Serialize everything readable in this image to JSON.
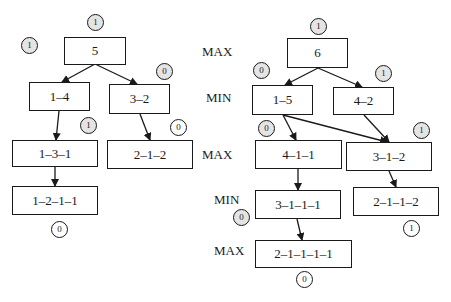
{
  "left_tree": {
    "nodes": [
      {
        "id": "L0",
        "label": "5",
        "badge": "1"
      },
      {
        "id": "L1",
        "label": "1–4",
        "badge": "1"
      },
      {
        "id": "L2",
        "label": "3–2",
        "badge": "0"
      },
      {
        "id": "L3",
        "label": "1–3–1",
        "badge": "1"
      },
      {
        "id": "L4",
        "label": "2–1–2",
        "badge": "0"
      },
      {
        "id": "L5",
        "label": "1–2–1–1",
        "badge": "0"
      }
    ],
    "edges": [
      [
        "L0",
        "L1"
      ],
      [
        "L0",
        "L2"
      ],
      [
        "L1",
        "L3"
      ],
      [
        "L2",
        "L4"
      ],
      [
        "L3",
        "L5"
      ]
    ]
  },
  "right_tree": {
    "levels": [
      "MAX",
      "MIN",
      "MAX",
      "MIN",
      "MAX"
    ],
    "nodes": [
      {
        "id": "R0",
        "label": "6",
        "badge": "1"
      },
      {
        "id": "R1",
        "label": "1–5",
        "badge": "0"
      },
      {
        "id": "R2",
        "label": "4–2",
        "badge": "1"
      },
      {
        "id": "R3",
        "label": "4–1–1",
        "badge": "0"
      },
      {
        "id": "R4",
        "label": "3–1–2",
        "badge": "1"
      },
      {
        "id": "R5",
        "label": "3–1–1–1",
        "badge": "0"
      },
      {
        "id": "R6",
        "label": "2–1–1–2",
        "badge": "1"
      },
      {
        "id": "R7",
        "label": "2–1–1–1–1",
        "badge": "0"
      }
    ],
    "edges": [
      [
        "R0",
        "R1"
      ],
      [
        "R0",
        "R2"
      ],
      [
        "R1",
        "R3"
      ],
      [
        "R1",
        "R4"
      ],
      [
        "R2",
        "R4"
      ],
      [
        "R3",
        "R5"
      ],
      [
        "R4",
        "R6"
      ],
      [
        "R5",
        "R7"
      ]
    ]
  },
  "colors": {
    "line": "#1a1a1a",
    "badge_fill": "#e4e4e4",
    "badge_fill_leaf": "#ffffff"
  }
}
